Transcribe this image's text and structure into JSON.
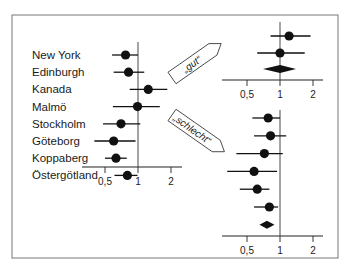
{
  "chart_data": {
    "type": "forest",
    "frame": {
      "x": 12,
      "y": 15,
      "w": 326,
      "h": 243
    },
    "scale": "log",
    "ticks": [
      {
        "value": 0.5,
        "label": "0,5"
      },
      {
        "value": 1,
        "label": "1"
      },
      {
        "value": 2,
        "label": "2"
      }
    ],
    "panels": [
      {
        "name": "all-studies",
        "ref_x": 138,
        "axis_y": 167,
        "axis_x0": 82,
        "axis_x1": 182,
        "ref_top": 42,
        "rows": [
          {
            "label": "New York",
            "est": 0.77,
            "lo": 0.58,
            "hi": 1.0
          },
          {
            "label": "Edinburgh",
            "est": 0.82,
            "lo": 0.6,
            "hi": 1.14
          },
          {
            "label": "Kanada",
            "est": 1.24,
            "lo": 0.84,
            "hi": 1.85
          },
          {
            "label": "Malmö",
            "est": 0.99,
            "lo": 0.59,
            "hi": 1.58
          },
          {
            "label": "Stockholm",
            "est": 0.7,
            "lo": 0.48,
            "hi": 1.05
          },
          {
            "label": "Göteborg",
            "est": 0.6,
            "lo": 0.4,
            "hi": 0.95
          },
          {
            "label": "Koppaberg",
            "est": 0.63,
            "lo": 0.5,
            "hi": 0.79
          },
          {
            "label": "Östergötland",
            "est": 0.8,
            "lo": 0.61,
            "hi": 0.99
          }
        ]
      },
      {
        "name": "good-studies",
        "ref_x": 280,
        "axis_y": 80,
        "axis_x0": 222,
        "axis_x1": 323,
        "ref_top": 22,
        "rows": [
          {
            "label": "",
            "est": 1.21,
            "lo": 0.82,
            "hi": 1.9
          },
          {
            "label": "",
            "est": 1.0,
            "lo": 0.62,
            "hi": 1.68
          }
        ],
        "summary": {
          "est": 1.0,
          "lo": 0.7,
          "hi": 1.4
        }
      },
      {
        "name": "poor-studies",
        "ref_x": 280,
        "axis_y": 236,
        "axis_x0": 222,
        "axis_x1": 323,
        "ref_top": 110,
        "rows": [
          {
            "label": "",
            "est": 0.78,
            "lo": 0.56,
            "hi": 1.0
          },
          {
            "label": "",
            "est": 0.82,
            "lo": 0.58,
            "hi": 1.14
          },
          {
            "label": "",
            "est": 0.72,
            "lo": 0.4,
            "hi": 1.06
          },
          {
            "label": "",
            "est": 0.58,
            "lo": 0.33,
            "hi": 0.94
          },
          {
            "label": "",
            "est": 0.62,
            "lo": 0.43,
            "hi": 0.8
          },
          {
            "label": "",
            "est": 0.8,
            "lo": 0.58,
            "hi": 0.96
          }
        ],
        "summary": {
          "est": 0.76,
          "lo": 0.65,
          "hi": 0.89
        }
      }
    ],
    "annotations": [
      {
        "text": "„gut“",
        "points_to": "good-studies"
      },
      {
        "text": "„schlecht“",
        "points_to": "poor-studies"
      }
    ],
    "title": "",
    "xlabel": "",
    "ylabel": ""
  }
}
